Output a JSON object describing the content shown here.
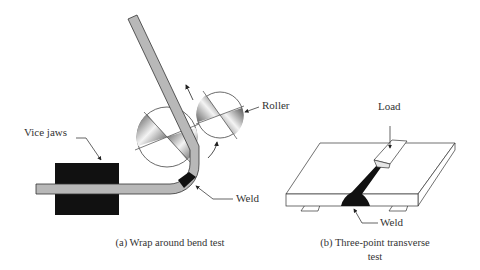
{
  "figure_a": {
    "labels": {
      "vice_jaws": "Vice jaws",
      "roller": "Roller",
      "weld": "Weld"
    },
    "caption": "(a) Wrap around bend test"
  },
  "figure_b": {
    "labels": {
      "load": "Load",
      "weld": "Weld"
    },
    "caption_line1": "(b) Three-point transverse",
    "caption_line2": "test"
  },
  "colors": {
    "bar": "#b8b8b8",
    "jaws": "#111111",
    "weld": "#111111",
    "outline": "#333333"
  }
}
